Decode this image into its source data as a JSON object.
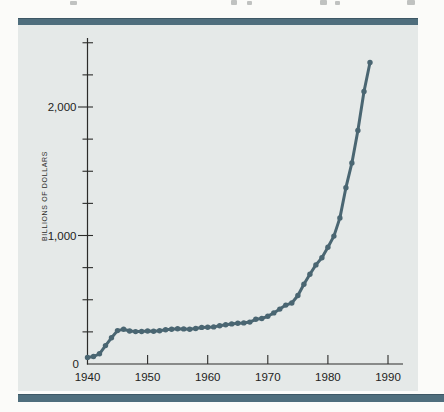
{
  "figure": {
    "page_color": "#fbfbf9",
    "panel_color": "#e5e9e8",
    "accent_bar_color": "#4f6e7d",
    "axis_color": "#2c2c2a",
    "text_color": "#232321"
  },
  "chart_data": {
    "type": "line",
    "title": "",
    "xlabel": "",
    "ylabel": "BILLIONS OF DOLLARS",
    "xlim": [
      1940,
      1990
    ],
    "ylim": [
      0,
      2500
    ],
    "grid": false,
    "legend": null,
    "x_tick_labels": [
      "1940",
      "1950",
      "1960",
      "1970",
      "1980",
      "1990"
    ],
    "x_tick_years": [
      1940,
      1950,
      1960,
      1970,
      1980,
      1990
    ],
    "y_tick_labels": [
      {
        "value": 0,
        "label": "0"
      },
      {
        "value": 1000,
        "label": "1,000"
      },
      {
        "value": 2000,
        "label": "2,000"
      }
    ],
    "y_minor_tick_step": 250,
    "line_color": "#4a6672",
    "marker": "circle",
    "series": [
      {
        "name": "",
        "x": [
          1940,
          1941,
          1942,
          1943,
          1944,
          1945,
          1946,
          1947,
          1948,
          1949,
          1950,
          1951,
          1952,
          1953,
          1954,
          1955,
          1956,
          1957,
          1958,
          1959,
          1960,
          1961,
          1962,
          1963,
          1964,
          1965,
          1966,
          1967,
          1968,
          1969,
          1970,
          1971,
          1972,
          1973,
          1974,
          1975,
          1976,
          1977,
          1978,
          1979,
          1980,
          1981,
          1982,
          1983,
          1984,
          1985,
          1986,
          1987
        ],
        "values": [
          51,
          58,
          79,
          143,
          204,
          260,
          271,
          257,
          252,
          253,
          257,
          255,
          259,
          266,
          271,
          274,
          273,
          271,
          276,
          285,
          286,
          289,
          298,
          306,
          312,
          317,
          320,
          326,
          348,
          354,
          371,
          398,
          427,
          458,
          475,
          533,
          620,
          699,
          771,
          827,
          908,
          995,
          1137,
          1372,
          1565,
          1818,
          2121,
          2346
        ]
      }
    ]
  }
}
